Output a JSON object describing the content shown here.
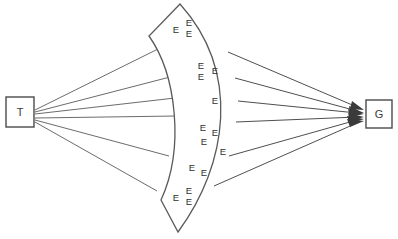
{
  "diagram": {
    "type": "node-link-fan",
    "background_color": "#ffffff",
    "stroke_color": "#5a5a5a",
    "text_color": "#2f2f2f",
    "nodes": [
      {
        "id": "source",
        "label": "T",
        "shape": "square",
        "x": 6,
        "y": 97,
        "width": 28,
        "height": 30
      },
      {
        "id": "goal",
        "label": "G",
        "shape": "square",
        "x": 366,
        "y": 100,
        "width": 26,
        "height": 28
      }
    ],
    "band": {
      "name": "expert-band",
      "label_glyph": "E",
      "shape": "curved-crescent",
      "outline": "M 180 4 L 149 36 C 176 74 185 146 161 200 L 178 232 C 226 164 239 72 180 4 Z",
      "inner_edge": "M 149 36 C 176 74 185 146 161 200",
      "outer_edge": "M 180 4 C 239 72 226 164 178 232",
      "label_count": 15,
      "labels": [
        {
          "text": "E",
          "x": 176,
          "y": 30
        },
        {
          "text": "E",
          "x": 189,
          "y": 24
        },
        {
          "text": "E",
          "x": 189,
          "y": 34
        },
        {
          "text": "E",
          "x": 201,
          "y": 66
        },
        {
          "text": "E",
          "x": 201,
          "y": 77
        },
        {
          "text": "E",
          "x": 214,
          "y": 71
        },
        {
          "text": "E",
          "x": 215,
          "y": 101
        },
        {
          "text": "E",
          "x": 203,
          "y": 128
        },
        {
          "text": "E",
          "x": 214,
          "y": 133
        },
        {
          "text": "E",
          "x": 204,
          "y": 142
        },
        {
          "text": "E",
          "x": 222,
          "y": 152
        },
        {
          "text": "E",
          "x": 192,
          "y": 168
        },
        {
          "text": "E",
          "x": 203,
          "y": 173
        },
        {
          "text": "E",
          "x": 176,
          "y": 198
        },
        {
          "text": "E",
          "x": 188,
          "y": 192
        },
        {
          "text": "E",
          "x": 188,
          "y": 202
        }
      ]
    },
    "left_edges": [
      {
        "from": "T",
        "to": "band",
        "d": "M 35 110 L 160 48"
      },
      {
        "from": "T",
        "to": "band",
        "d": "M 35 112 L 170 77"
      },
      {
        "from": "T",
        "to": "band",
        "d": "M 35 114 L 175 98"
      },
      {
        "from": "T",
        "to": "band",
        "d": "M 35 118 L 176 115"
      },
      {
        "from": "T",
        "to": "band",
        "d": "M 35 120 L 169 156"
      },
      {
        "from": "T",
        "to": "band",
        "d": "M 35 122 L 157 191"
      }
    ],
    "right_edges": [
      {
        "from": "band",
        "to": "G",
        "d": "M 228 52 L 362 108",
        "arrow": true
      },
      {
        "from": "band",
        "to": "G",
        "d": "M 235 78 L 362 112",
        "arrow": true
      },
      {
        "from": "band",
        "to": "G",
        "d": "M 238 101 L 362 114",
        "arrow": true
      },
      {
        "from": "band",
        "to": "G",
        "d": "M 236 122 L 362 117",
        "arrow": true
      },
      {
        "from": "band",
        "to": "G",
        "d": "M 229 156 L 362 120",
        "arrow": true
      },
      {
        "from": "band",
        "to": "G",
        "d": "M 214 186 L 362 123",
        "arrow": true
      }
    ]
  }
}
